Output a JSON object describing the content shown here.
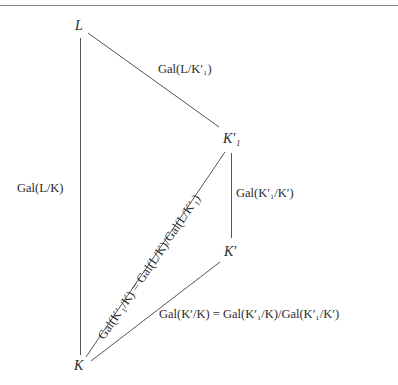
{
  "diagram": {
    "type": "galois-field-lattice",
    "nodes": {
      "L": "L",
      "K1p": "K′₁",
      "Kp": "K′",
      "K": "K"
    },
    "edges": [
      {
        "from": "L",
        "to": "K",
        "label": "Gal(L/K)"
      },
      {
        "from": "L",
        "to": "K1p",
        "label": "Gal(L/K′₁)"
      },
      {
        "from": "K1p",
        "to": "Kp",
        "label": "Gal(K′₁/K′)"
      },
      {
        "from": "K",
        "to": "K1p",
        "label": "Gal(K′₁/K) = Gal(L/K)/Gal(L/K′₁)"
      },
      {
        "from": "K",
        "to": "Kp",
        "label": "Gal(K′/K) = Gal(K′₁/K)/Gal(K′₁/K′)"
      }
    ],
    "colors": {
      "line": "#555555",
      "text": "#2a2a2a",
      "rule": "#8a8a8a"
    }
  }
}
